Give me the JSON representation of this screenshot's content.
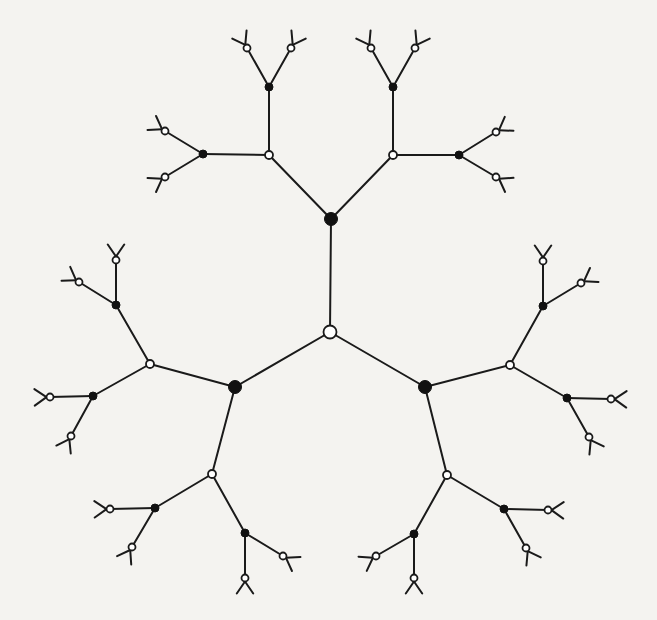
{
  "diagram": {
    "title": "",
    "type": "tree",
    "colors": {
      "background": "#f4f3f0",
      "line": "#1a1a1a",
      "filled": "#111111",
      "open": "#ffffff"
    },
    "nodes": [
      {
        "id": "root",
        "x": 330,
        "y": 332,
        "r": 6.5,
        "kind": "open"
      },
      {
        "id": "A",
        "x": 331,
        "y": 219,
        "r": 6.5,
        "kind": "black"
      },
      {
        "id": "B",
        "x": 235,
        "y": 387,
        "r": 6.5,
        "kind": "black"
      },
      {
        "id": "C",
        "x": 425,
        "y": 387,
        "r": 6.5,
        "kind": "black"
      },
      {
        "id": "A1",
        "x": 269,
        "y": 155,
        "r": 4,
        "kind": "open"
      },
      {
        "id": "A2",
        "x": 393,
        "y": 155,
        "r": 4,
        "kind": "open"
      },
      {
        "id": "B1",
        "x": 150,
        "y": 364,
        "r": 4,
        "kind": "open"
      },
      {
        "id": "B2",
        "x": 212,
        "y": 474,
        "r": 4,
        "kind": "open"
      },
      {
        "id": "C1",
        "x": 510,
        "y": 365,
        "r": 4,
        "kind": "open"
      },
      {
        "id": "C2",
        "x": 447,
        "y": 475,
        "r": 4,
        "kind": "open"
      },
      {
        "id": "A1a",
        "x": 269,
        "y": 87,
        "r": 4,
        "kind": "black"
      },
      {
        "id": "A1b",
        "x": 203,
        "y": 154,
        "r": 4,
        "kind": "black"
      },
      {
        "id": "A2a",
        "x": 393,
        "y": 87,
        "r": 4,
        "kind": "black"
      },
      {
        "id": "A2b",
        "x": 459,
        "y": 155,
        "r": 4,
        "kind": "black"
      },
      {
        "id": "B1a",
        "x": 116,
        "y": 305,
        "r": 4,
        "kind": "black"
      },
      {
        "id": "B1b",
        "x": 93,
        "y": 396,
        "r": 4,
        "kind": "black"
      },
      {
        "id": "B2a",
        "x": 155,
        "y": 508,
        "r": 4,
        "kind": "black"
      },
      {
        "id": "B2b",
        "x": 245,
        "y": 533,
        "r": 4,
        "kind": "black"
      },
      {
        "id": "C1a",
        "x": 543,
        "y": 306,
        "r": 4,
        "kind": "black"
      },
      {
        "id": "C1b",
        "x": 567,
        "y": 398,
        "r": 4,
        "kind": "black"
      },
      {
        "id": "C2a",
        "x": 504,
        "y": 509,
        "r": 4,
        "kind": "black"
      },
      {
        "id": "C2b",
        "x": 414,
        "y": 534,
        "r": 4,
        "kind": "black"
      },
      {
        "id": "L1",
        "x": 247,
        "y": 48,
        "r": 3.5,
        "kind": "open"
      },
      {
        "id": "L2",
        "x": 291,
        "y": 48,
        "r": 3.5,
        "kind": "open"
      },
      {
        "id": "L3",
        "x": 165,
        "y": 131,
        "r": 3.5,
        "kind": "open"
      },
      {
        "id": "L4",
        "x": 165,
        "y": 177,
        "r": 3.5,
        "kind": "open"
      },
      {
        "id": "L5",
        "x": 371,
        "y": 48,
        "r": 3.5,
        "kind": "open"
      },
      {
        "id": "L6",
        "x": 415,
        "y": 48,
        "r": 3.5,
        "kind": "open"
      },
      {
        "id": "L7",
        "x": 496,
        "y": 132,
        "r": 3.5,
        "kind": "open"
      },
      {
        "id": "L8",
        "x": 496,
        "y": 177,
        "r": 3.5,
        "kind": "open"
      },
      {
        "id": "L9",
        "x": 116,
        "y": 260,
        "r": 3.5,
        "kind": "open"
      },
      {
        "id": "L10",
        "x": 79,
        "y": 282,
        "r": 3.5,
        "kind": "open"
      },
      {
        "id": "L11",
        "x": 50,
        "y": 397,
        "r": 3.5,
        "kind": "open"
      },
      {
        "id": "L12",
        "x": 71,
        "y": 436,
        "r": 3.5,
        "kind": "open"
      },
      {
        "id": "L13",
        "x": 110,
        "y": 509,
        "r": 3.5,
        "kind": "open"
      },
      {
        "id": "L14",
        "x": 132,
        "y": 547,
        "r": 3.5,
        "kind": "open"
      },
      {
        "id": "L15",
        "x": 245,
        "y": 578,
        "r": 3.5,
        "kind": "open"
      },
      {
        "id": "L16",
        "x": 283,
        "y": 556,
        "r": 3.5,
        "kind": "open"
      },
      {
        "id": "L17",
        "x": 543,
        "y": 261,
        "r": 3.5,
        "kind": "open"
      },
      {
        "id": "L18",
        "x": 581,
        "y": 283,
        "r": 3.5,
        "kind": "open"
      },
      {
        "id": "L19",
        "x": 611,
        "y": 399,
        "r": 3.5,
        "kind": "open"
      },
      {
        "id": "L20",
        "x": 589,
        "y": 437,
        "r": 3.5,
        "kind": "open"
      },
      {
        "id": "L21",
        "x": 548,
        "y": 510,
        "r": 3.5,
        "kind": "open"
      },
      {
        "id": "L22",
        "x": 526,
        "y": 548,
        "r": 3.5,
        "kind": "open"
      },
      {
        "id": "L23",
        "x": 414,
        "y": 578,
        "r": 3.5,
        "kind": "open"
      },
      {
        "id": "L24",
        "x": 376,
        "y": 556,
        "r": 3.5,
        "kind": "open"
      }
    ],
    "edges": [
      [
        "root",
        "A"
      ],
      [
        "root",
        "B"
      ],
      [
        "root",
        "C"
      ],
      [
        "A",
        "A1"
      ],
      [
        "A",
        "A2"
      ],
      [
        "B",
        "B1"
      ],
      [
        "B",
        "B2"
      ],
      [
        "C",
        "C1"
      ],
      [
        "C",
        "C2"
      ],
      [
        "A1",
        "A1a"
      ],
      [
        "A1",
        "A1b"
      ],
      [
        "A2",
        "A2a"
      ],
      [
        "A2",
        "A2b"
      ],
      [
        "B1",
        "B1a"
      ],
      [
        "B1",
        "B1b"
      ],
      [
        "B2",
        "B2a"
      ],
      [
        "B2",
        "B2b"
      ],
      [
        "C1",
        "C1a"
      ],
      [
        "C1",
        "C1b"
      ],
      [
        "C2",
        "C2a"
      ],
      [
        "C2",
        "C2b"
      ],
      [
        "A1a",
        "L1"
      ],
      [
        "A1a",
        "L2"
      ],
      [
        "A1b",
        "L3"
      ],
      [
        "A1b",
        "L4"
      ],
      [
        "A2a",
        "L5"
      ],
      [
        "A2a",
        "L6"
      ],
      [
        "A2b",
        "L7"
      ],
      [
        "A2b",
        "L8"
      ],
      [
        "B1a",
        "L9"
      ],
      [
        "B1a",
        "L10"
      ],
      [
        "B1b",
        "L11"
      ],
      [
        "B1b",
        "L12"
      ],
      [
        "B2a",
        "L13"
      ],
      [
        "B2a",
        "L14"
      ],
      [
        "B2b",
        "L15"
      ],
      [
        "B2b",
        "L16"
      ],
      [
        "C1a",
        "L17"
      ],
      [
        "C1a",
        "L18"
      ],
      [
        "C1b",
        "L19"
      ],
      [
        "C1b",
        "L20"
      ],
      [
        "C2a",
        "L21"
      ],
      [
        "C2a",
        "L22"
      ],
      [
        "C2b",
        "L23"
      ],
      [
        "C2b",
        "L24"
      ]
    ],
    "leaf_stub_length": 14,
    "leaf_stub_spread_deg": 28
  }
}
